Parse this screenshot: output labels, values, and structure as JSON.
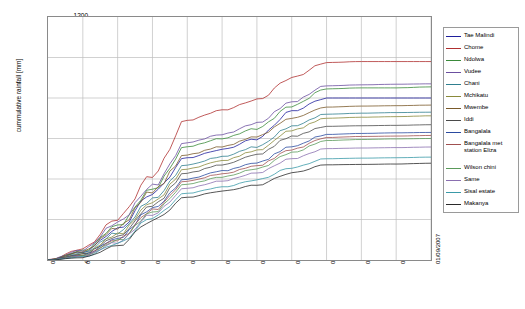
{
  "chart_data": {
    "type": "line",
    "title": "",
    "xlabel": "",
    "ylabel": "cummulative rainfall [mm]",
    "ylim": [
      0,
      1200
    ],
    "y_ticks": [
      0,
      200,
      400,
      600,
      800,
      1000,
      1200
    ],
    "grid": true,
    "legend_position": "right",
    "x": [
      "01/10/2006",
      "01/11/2006",
      "01/12/2006",
      "01/01/2007",
      "01/02/2007",
      "01/03/2007",
      "01/04/2007",
      "01/05/2007",
      "01/06/2007",
      "01/07/2007",
      "01/08/2007",
      "01/09/2007"
    ],
    "x_tick_labels": [
      "01/10/2006",
      "01/11/2006",
      "01/12/2006",
      "01/01/2007",
      "01/02/2007",
      "01/03/2007",
      "01/04/2007",
      "01/05/2007",
      "01/06/2007",
      "01/07/2007",
      "01/08/2007",
      "01/09/2007"
    ],
    "series": [
      {
        "name": "Tae Malindi",
        "color": "#1f1f9c",
        "values": [
          0,
          40,
          150,
          330,
          505,
          545,
          600,
          735,
          800,
          800,
          800,
          800
        ]
      },
      {
        "name": "Chome",
        "color": "#b03030",
        "values": [
          0,
          55,
          205,
          420,
          690,
          740,
          790,
          900,
          975,
          980,
          980,
          980
        ]
      },
      {
        "name": "Ndolwa",
        "color": "#3a8a3a",
        "values": [
          0,
          45,
          170,
          350,
          560,
          600,
          650,
          760,
          845,
          850,
          850,
          855
        ]
      },
      {
        "name": "Vudee",
        "color": "#6b4fa0",
        "values": [
          0,
          50,
          185,
          365,
          580,
          620,
          675,
          780,
          860,
          865,
          868,
          870
        ]
      },
      {
        "name": "Chani",
        "color": "#2f7f8f",
        "values": [
          0,
          35,
          135,
          300,
          470,
          510,
          560,
          660,
          720,
          725,
          728,
          730
        ]
      },
      {
        "name": "Mchikatu",
        "color": "#8a8a3a",
        "values": [
          0,
          30,
          125,
          285,
          450,
          490,
          540,
          640,
          700,
          705,
          708,
          712
        ]
      },
      {
        "name": "Mwembe",
        "color": "#7a5a2a",
        "values": [
          0,
          42,
          160,
          340,
          520,
          560,
          610,
          700,
          755,
          760,
          762,
          765
        ]
      },
      {
        "name": "Iddi",
        "color": "#4a4a4a",
        "values": [
          0,
          28,
          115,
          270,
          430,
          470,
          520,
          610,
          660,
          663,
          665,
          668
        ]
      },
      {
        "name": "Bangalala",
        "color": "#2a4aa0",
        "values": [
          0,
          25,
          105,
          255,
          400,
          440,
          480,
          560,
          620,
          625,
          628,
          630
        ]
      },
      {
        "name": "Bangalala met station Eliza",
        "color": "#a05050",
        "values": [
          0,
          22,
          100,
          245,
          390,
          425,
          465,
          545,
          605,
          610,
          612,
          615
        ]
      },
      {
        "name": "Wilson chini",
        "color": "#5a9a5a",
        "values": [
          0,
          20,
          95,
          235,
          375,
          410,
          450,
          530,
          590,
          595,
          598,
          600
        ]
      },
      {
        "name": "Same",
        "color": "#8a6fb0",
        "values": [
          0,
          18,
          88,
          225,
          355,
          390,
          430,
          500,
          550,
          553,
          555,
          558
        ]
      },
      {
        "name": "Sisal estate",
        "color": "#3a9aa8",
        "values": [
          0,
          15,
          80,
          210,
          330,
          360,
          395,
          455,
          500,
          503,
          505,
          508
        ]
      },
      {
        "name": "Makanya",
        "color": "#2a2a2a",
        "values": [
          0,
          12,
          70,
          195,
          310,
          340,
          370,
          430,
          470,
          472,
          474,
          478
        ]
      }
    ]
  },
  "legend": {
    "items": [
      {
        "label": "Tae Malindi",
        "color": "#1f1f9c"
      },
      {
        "label": "Chome",
        "color": "#b03030"
      },
      {
        "label": "Ndolwa",
        "color": "#3a8a3a"
      },
      {
        "label": "Vudee",
        "color": "#6b4fa0"
      },
      {
        "label": "Chani",
        "color": "#2f7f8f"
      },
      {
        "label": "Mchikatu",
        "color": "#8a8a3a"
      },
      {
        "label": "Mwembe",
        "color": "#7a5a2a"
      },
      {
        "label": "Iddi",
        "color": "#4a4a4a"
      },
      {
        "label": "Bangalala",
        "color": "#2a4aa0"
      },
      {
        "label": "Bangalala met station Eliza",
        "color": "#a05050"
      },
      {
        "label": "Wilson chini",
        "color": "#5a9a5a"
      },
      {
        "label": "Same",
        "color": "#8a6fb0"
      },
      {
        "label": "Sisal estate",
        "color": "#3a9aa8"
      },
      {
        "label": "Makanya",
        "color": "#2a2a2a"
      }
    ]
  }
}
